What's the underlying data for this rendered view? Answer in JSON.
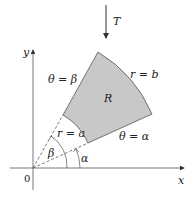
{
  "diagram": {
    "title": "",
    "transform_label": "T",
    "axes": {
      "x_label": "x",
      "y_label": "y",
      "origin_label": "0"
    },
    "region_label": "R",
    "boundaries": {
      "ray_beta": "θ = β",
      "ray_alpha": "θ = α",
      "arc_inner": "r = a",
      "arc_outer": "r = b"
    },
    "angles": {
      "alpha": "α",
      "beta": "β"
    },
    "colors": {
      "region_fill": "#c8c8c8",
      "stroke": "#444444"
    }
  }
}
